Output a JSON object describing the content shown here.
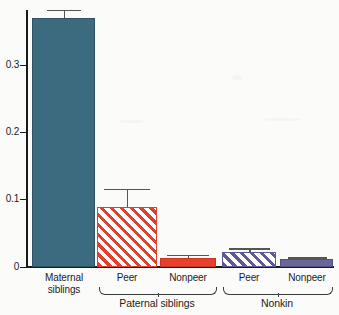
{
  "chart_data": {
    "type": "bar",
    "title": "",
    "subtitle": "",
    "xlabel": "",
    "ylabel": "",
    "ylim": [
      0,
      0.38
    ],
    "grid": false,
    "legend": "none",
    "yticks": [
      0,
      0.1,
      0.2,
      0.3
    ],
    "ytick_labels": [
      "0",
      "0.1",
      "0.2",
      "0.3"
    ],
    "categories": [
      "Maternal siblings",
      "Peer",
      "Nonpeer",
      "Peer",
      "Nonpeer"
    ],
    "values": [
      0.37,
      0.089,
      0.013,
      0.022,
      0.012
    ],
    "errors_upper": [
      0.382,
      0.116,
      0.018,
      0.028,
      0.0145
    ],
    "bars": [
      {
        "label": "Maternal\nsiblings",
        "label_line1": "Maternal",
        "label_line2": "siblings",
        "value": 0.37,
        "error_upper": 0.382,
        "style": "solid",
        "color": "#3c6b80",
        "group": ""
      },
      {
        "label": "Peer",
        "label_line1": "Peer",
        "label_line2": "",
        "value": 0.089,
        "error_upper": 0.116,
        "style": "hatched",
        "color": "#e04030",
        "group": "Paternal siblings"
      },
      {
        "label": "Nonpeer",
        "label_line1": "Nonpeer",
        "label_line2": "",
        "value": 0.013,
        "error_upper": 0.018,
        "style": "solid",
        "color": "#e8402c",
        "group": "Paternal siblings"
      },
      {
        "label": "Peer",
        "label_line1": "Peer",
        "label_line2": "",
        "value": 0.022,
        "error_upper": 0.028,
        "style": "hatched",
        "color": "#5d5a97",
        "group": "Nonkin"
      },
      {
        "label": "Nonpeer",
        "label_line1": "Nonpeer",
        "label_line2": "",
        "value": 0.012,
        "error_upper": 0.0145,
        "style": "solid",
        "color": "#6b6699",
        "group": "Nonkin"
      }
    ],
    "groups": [
      {
        "name": "Paternal siblings",
        "members": [
          "Peer",
          "Nonpeer"
        ]
      },
      {
        "name": "Nonkin",
        "members": [
          "Peer",
          "Nonpeer"
        ]
      }
    ],
    "colors": {
      "maternal": "#3c6b80",
      "paternal": "#e04030",
      "nonkin": "#5d5a97",
      "error": "#555555",
      "axis": "#1a1a1a"
    }
  }
}
